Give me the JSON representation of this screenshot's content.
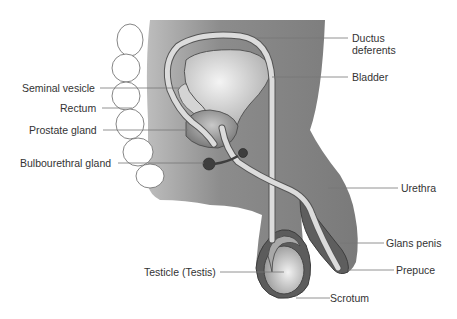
{
  "diagram": {
    "type": "anatomical-cross-section",
    "colors": {
      "body_fill": "#8a8a8a",
      "body_dark": "#6e6e6e",
      "organ_light": "#e6e6e6",
      "tube_fill": "#d9d9d9",
      "gland_dark": "#4a4a4a",
      "outline": "#444444",
      "leader_line": "#777777",
      "label_text": "#333333"
    },
    "labels": {
      "seminal_vesicle": "Seminal vesicle",
      "rectum": "Rectum",
      "prostate_gland": "Prostate gland",
      "bulbourethral_gland": "Bulbourethral gland",
      "testicle": "Testicle (Testis)",
      "ductus_deferens_line1": "Ductus",
      "ductus_deferens_line2": "deferents",
      "bladder": "Bladder",
      "urethra": "Urethra",
      "glans_penis": "Glans penis",
      "prepuce": "Prepuce",
      "scrotum": "Scrotum"
    }
  }
}
